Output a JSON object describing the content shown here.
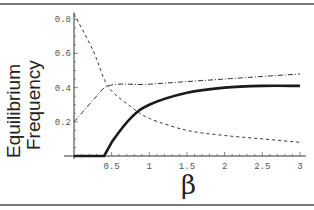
{
  "chart_data": {
    "type": "line",
    "title": "",
    "xlabel": "β",
    "ylabel_lines": [
      "Equilibrium",
      "Frequency"
    ],
    "xlim": [
      0,
      3
    ],
    "ylim": [
      0,
      0.85
    ],
    "x_ticks": [
      "0.5",
      "1",
      "1.5",
      "2",
      "2.5",
      "3"
    ],
    "y_ticks": [
      "0.2",
      "0.4",
      "0.6",
      "0.8"
    ],
    "grid": false,
    "legend": null,
    "series": [
      {
        "name": "solid",
        "style": "solid-thick",
        "x": [
          0,
          0.4,
          0.5,
          0.75,
          1.0,
          1.5,
          2.0,
          2.5,
          3.0
        ],
        "values": [
          0,
          0,
          0.08,
          0.22,
          0.3,
          0.37,
          0.4,
          0.41,
          0.41
        ]
      },
      {
        "name": "dashed",
        "style": "dashed",
        "x": [
          0,
          0.25,
          0.4,
          0.5,
          0.75,
          1.0,
          1.5,
          2.0,
          2.5,
          3.0
        ],
        "values": [
          0.83,
          0.62,
          0.45,
          0.38,
          0.29,
          0.22,
          0.15,
          0.12,
          0.1,
          0.08
        ]
      },
      {
        "name": "dash-dot",
        "style": "dash-dot",
        "x": [
          0,
          0.4,
          1.0,
          2.0,
          3.0
        ],
        "values": [
          0.2,
          0.4,
          0.42,
          0.45,
          0.48
        ]
      }
    ]
  }
}
